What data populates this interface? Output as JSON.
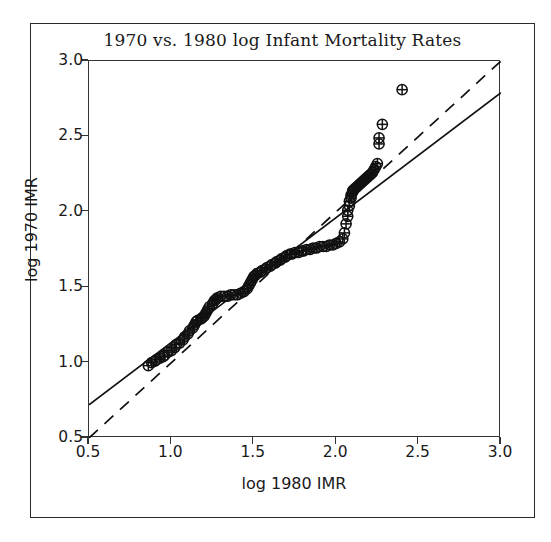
{
  "figure": {
    "title": "1970 vs. 1980 log Infant Mortality Rates",
    "background_color": "#ffffff",
    "foreground_color": "#1a1a1a"
  },
  "axes": {
    "x_title": "log 1980 IMR",
    "y_title": "log 1970 IMR",
    "x_ticks": [
      "0.5",
      "1.0",
      "1.5",
      "2.0",
      "2.5",
      "3.0"
    ],
    "y_ticks": [
      "0.5",
      "1.0",
      "1.5",
      "2.0",
      "2.5",
      "3.0"
    ]
  },
  "chart_data": {
    "type": "scatter",
    "title": "1970 vs. 1980 log Infant Mortality Rates",
    "xlabel": "log 1980 IMR",
    "ylabel": "log 1970 IMR",
    "xlim": [
      0.5,
      3.0
    ],
    "ylim": [
      0.5,
      3.0
    ],
    "grid": false,
    "legend": null,
    "marker": "circle-plus",
    "marker_color": "#111111",
    "series": [
      {
        "name": "countries",
        "marker": "circle-plus",
        "points": [
          [
            0.86,
            0.98
          ],
          [
            0.88,
            1.0
          ],
          [
            0.9,
            1.01
          ],
          [
            0.91,
            1.02
          ],
          [
            0.93,
            1.03
          ],
          [
            0.95,
            1.04
          ],
          [
            0.96,
            1.05
          ],
          [
            0.98,
            1.07
          ],
          [
            1.0,
            1.08
          ],
          [
            1.02,
            1.1
          ],
          [
            1.03,
            1.12
          ],
          [
            1.05,
            1.13
          ],
          [
            1.07,
            1.15
          ],
          [
            1.08,
            1.17
          ],
          [
            1.1,
            1.19
          ],
          [
            1.11,
            1.21
          ],
          [
            1.13,
            1.23
          ],
          [
            1.14,
            1.25
          ],
          [
            1.15,
            1.27
          ],
          [
            1.16,
            1.28
          ],
          [
            1.18,
            1.29
          ],
          [
            1.19,
            1.3
          ],
          [
            1.2,
            1.31
          ],
          [
            1.21,
            1.33
          ],
          [
            1.22,
            1.35
          ],
          [
            1.23,
            1.37
          ],
          [
            1.25,
            1.39
          ],
          [
            1.26,
            1.41
          ],
          [
            1.27,
            1.42
          ],
          [
            1.28,
            1.43
          ],
          [
            1.3,
            1.44
          ],
          [
            1.32,
            1.44
          ],
          [
            1.34,
            1.44
          ],
          [
            1.36,
            1.45
          ],
          [
            1.38,
            1.45
          ],
          [
            1.4,
            1.45
          ],
          [
            1.42,
            1.46
          ],
          [
            1.44,
            1.47
          ],
          [
            1.46,
            1.49
          ],
          [
            1.47,
            1.51
          ],
          [
            1.48,
            1.53
          ],
          [
            1.49,
            1.55
          ],
          [
            1.5,
            1.57
          ],
          [
            1.51,
            1.58
          ],
          [
            1.52,
            1.59
          ],
          [
            1.54,
            1.6
          ],
          [
            1.55,
            1.61
          ],
          [
            1.57,
            1.62
          ],
          [
            1.58,
            1.63
          ],
          [
            1.6,
            1.64
          ],
          [
            1.61,
            1.65
          ],
          [
            1.63,
            1.66
          ],
          [
            1.64,
            1.67
          ],
          [
            1.66,
            1.68
          ],
          [
            1.67,
            1.69
          ],
          [
            1.69,
            1.7
          ],
          [
            1.7,
            1.71
          ],
          [
            1.72,
            1.72
          ],
          [
            1.73,
            1.72
          ],
          [
            1.75,
            1.73
          ],
          [
            1.77,
            1.73
          ],
          [
            1.79,
            1.74
          ],
          [
            1.8,
            1.74
          ],
          [
            1.82,
            1.75
          ],
          [
            1.84,
            1.75
          ],
          [
            1.86,
            1.76
          ],
          [
            1.88,
            1.76
          ],
          [
            1.9,
            1.77
          ],
          [
            1.92,
            1.77
          ],
          [
            1.94,
            1.77
          ],
          [
            1.96,
            1.78
          ],
          [
            1.98,
            1.78
          ],
          [
            2.0,
            1.79
          ],
          [
            2.02,
            1.8
          ],
          [
            2.04,
            1.82
          ],
          [
            2.05,
            1.86
          ],
          [
            2.06,
            1.92
          ],
          [
            2.07,
            1.97
          ],
          [
            2.07,
            2.01
          ],
          [
            2.08,
            2.04
          ],
          [
            2.08,
            2.07
          ],
          [
            2.09,
            2.09
          ],
          [
            2.09,
            2.11
          ],
          [
            2.1,
            2.13
          ],
          [
            2.1,
            2.14
          ],
          [
            2.11,
            2.15
          ],
          [
            2.12,
            2.16
          ],
          [
            2.13,
            2.17
          ],
          [
            2.14,
            2.18
          ],
          [
            2.15,
            2.19
          ],
          [
            2.16,
            2.2
          ],
          [
            2.17,
            2.21
          ],
          [
            2.18,
            2.22
          ],
          [
            2.19,
            2.23
          ],
          [
            2.2,
            2.24
          ],
          [
            2.21,
            2.25
          ],
          [
            2.22,
            2.26
          ],
          [
            2.23,
            2.28
          ],
          [
            2.24,
            2.3
          ],
          [
            2.25,
            2.32
          ],
          [
            2.26,
            2.45
          ],
          [
            2.26,
            2.49
          ],
          [
            2.28,
            2.58
          ],
          [
            2.4,
            2.81
          ]
        ]
      }
    ],
    "reference_lines": [
      {
        "name": "identity-line",
        "style": "dashed",
        "color": "#111111",
        "from": [
          0.5,
          0.5
        ],
        "to": [
          3.0,
          3.0
        ],
        "description": "y = x reference line"
      },
      {
        "name": "regression-line",
        "style": "solid",
        "color": "#111111",
        "from": [
          0.5,
          0.72
        ],
        "to": [
          3.0,
          2.79
        ],
        "description": "fitted least-squares line"
      }
    ]
  }
}
